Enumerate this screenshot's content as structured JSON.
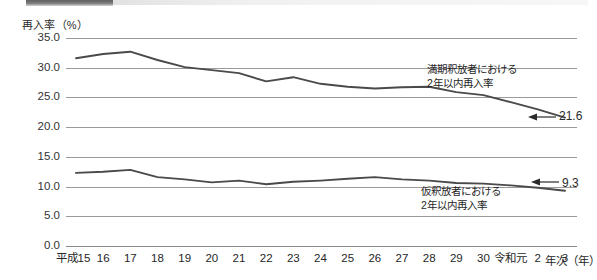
{
  "chart_data": {
    "type": "line",
    "title": "",
    "xlabel": "年次（年）",
    "ylabel": "再入率（%）",
    "ylim": [
      0.0,
      35.0
    ],
    "yticks": [
      "0.0",
      "5.0",
      "10.0",
      "15.0",
      "20.0",
      "25.0",
      "30.0",
      "35.0"
    ],
    "grid": true,
    "legend_position": "inline-annotation",
    "categories": [
      "平成15",
      "16",
      "17",
      "18",
      "19",
      "20",
      "21",
      "22",
      "23",
      "24",
      "25",
      "26",
      "27",
      "28",
      "29",
      "30",
      "令和元",
      "2",
      "3"
    ],
    "series": [
      {
        "name": "満期釈放者における2年以内再入率",
        "values": [
          31.6,
          32.3,
          32.7,
          31.3,
          30.1,
          29.6,
          29.1,
          27.7,
          28.4,
          27.3,
          26.8,
          26.5,
          26.7,
          26.8,
          25.9,
          25.4,
          24.2,
          23.0,
          21.6
        ],
        "end_label": "21.6"
      },
      {
        "name": "仮釈放者における2年以内再入率",
        "values": [
          12.3,
          12.5,
          12.8,
          11.6,
          11.2,
          10.7,
          11.0,
          10.4,
          10.8,
          11.0,
          11.3,
          11.6,
          11.2,
          11.0,
          10.6,
          10.5,
          10.2,
          9.8,
          9.3
        ],
        "end_label": "9.3"
      }
    ],
    "annotations": [
      {
        "id": "upper",
        "line1": "満期釈放者における",
        "line2": "2年以内再入率"
      },
      {
        "id": "lower",
        "line1": "仮釈放者における",
        "line2": "2年以内再入率"
      }
    ],
    "colors": {
      "line": "#4a4a4a",
      "grid": "#9a9a9a",
      "text": "#2b2b2b"
    }
  }
}
